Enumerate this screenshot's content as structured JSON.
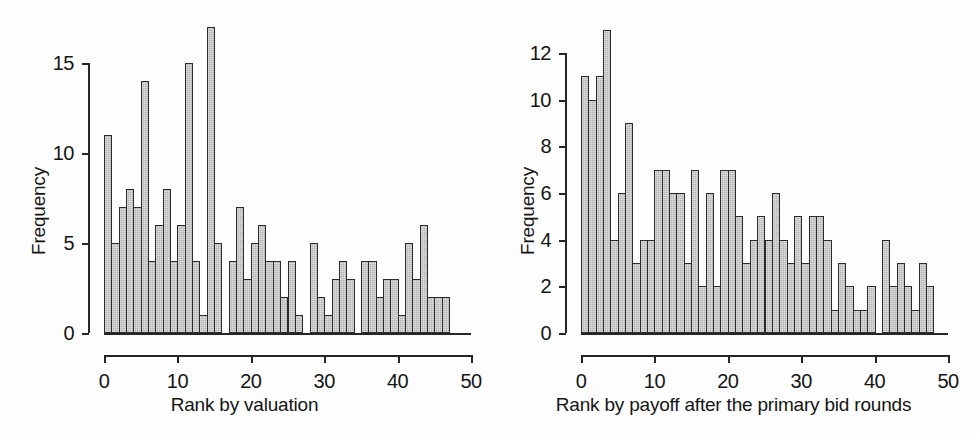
{
  "figure": {
    "background_color": "#fdfdfd",
    "bar_fill_color": "#b3b3b3",
    "bar_stroke_color": "#2b2b2b",
    "axis_color": "#262626"
  },
  "panels": [
    {
      "id": "left",
      "ylabel": "Frequency",
      "xlabel": "Rank by valuation",
      "yticks": [
        "0",
        "5",
        "10",
        "15"
      ],
      "xticks": [
        "0",
        "10",
        "20",
        "30",
        "40",
        "50"
      ]
    },
    {
      "id": "right",
      "ylabel": "Frequency",
      "xlabel": "Rank by payoff after the primary bid rounds",
      "yticks": [
        "0",
        "2",
        "4",
        "6",
        "8",
        "10",
        "12"
      ],
      "xticks": [
        "0",
        "10",
        "20",
        "30",
        "40",
        "50"
      ]
    }
  ],
  "chart_data": [
    {
      "type": "bar",
      "title": "",
      "xlabel": "Rank by valuation",
      "ylabel": "Frequency",
      "xlim": [
        0,
        50
      ],
      "ylim": [
        0,
        17
      ],
      "yticks": [
        0,
        5,
        10,
        15
      ],
      "xticks": [
        0,
        10,
        20,
        30,
        40,
        50
      ],
      "grid": false,
      "legend": "none",
      "bin_width": 1,
      "categories": [
        0,
        1,
        2,
        3,
        4,
        5,
        6,
        7,
        8,
        9,
        10,
        11,
        12,
        13,
        14,
        15,
        16,
        17,
        18,
        19,
        20,
        21,
        22,
        23,
        24,
        25,
        26,
        27,
        28,
        29,
        30,
        31,
        32,
        33,
        34,
        35,
        36,
        37,
        38,
        39,
        40,
        41,
        42,
        43,
        44,
        45,
        46,
        47
      ],
      "values": [
        11,
        5,
        7,
        8,
        7,
        14,
        4,
        6,
        8,
        4,
        6,
        15,
        4,
        1,
        17,
        5,
        0,
        4,
        7,
        3,
        5,
        6,
        4,
        4,
        2,
        4,
        1,
        0,
        5,
        2,
        1,
        3,
        4,
        3,
        0,
        4,
        4,
        2,
        3,
        3,
        1,
        5,
        3,
        6,
        2,
        2,
        2,
        0
      ]
    },
    {
      "type": "bar",
      "title": "",
      "xlabel": "Rank by payoff after the primary bid rounds",
      "ylabel": "Frequency",
      "xlim": [
        0,
        50
      ],
      "ylim": [
        0,
        13
      ],
      "yticks": [
        0,
        2,
        4,
        6,
        8,
        10,
        12
      ],
      "xticks": [
        0,
        10,
        20,
        30,
        40,
        50
      ],
      "grid": false,
      "legend": "none",
      "bin_width": 1,
      "categories": [
        0,
        1,
        2,
        3,
        4,
        5,
        6,
        7,
        8,
        9,
        10,
        11,
        12,
        13,
        14,
        15,
        16,
        17,
        18,
        19,
        20,
        21,
        22,
        23,
        24,
        25,
        26,
        27,
        28,
        29,
        30,
        31,
        32,
        33,
        34,
        35,
        36,
        37,
        38,
        39,
        40,
        41,
        42,
        43,
        44,
        45,
        46,
        47,
        48
      ],
      "values": [
        11,
        10,
        11,
        13,
        4,
        6,
        9,
        3,
        4,
        4,
        7,
        7,
        6,
        6,
        3,
        7,
        2,
        6,
        2,
        7,
        7,
        5,
        3,
        4,
        5,
        4,
        6,
        4,
        3,
        5,
        3,
        5,
        5,
        4,
        1,
        3,
        2,
        1,
        1,
        2,
        0,
        4,
        2,
        3,
        2,
        1,
        3,
        2,
        0
      ]
    }
  ]
}
